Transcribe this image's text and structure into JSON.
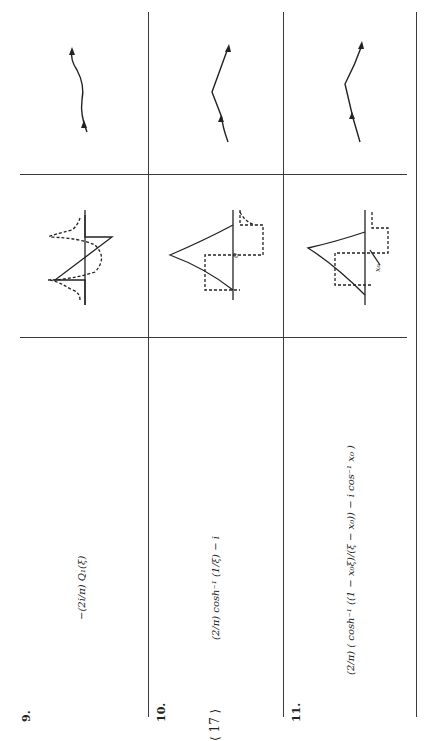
{
  "page_number": "⟨ 17 ⟩",
  "rows": [
    {
      "number": "9.",
      "formula": "−(2i/π) Q₁(ξ)",
      "diagram": "sawtooth-with-dashed-singular-curve",
      "contour": "wavy-path-with-arrows"
    },
    {
      "number": "10.",
      "formula": "(2/π) cosh⁻¹ (1/ξ) − i",
      "diagram": "cusp-peak-with-dashed-step",
      "diagram_label": "0",
      "contour": "v-shaped-path-with-arrows"
    },
    {
      "number": "11.",
      "formula": "(2/π) ( cosh⁻¹ ((1 − x₀ξ)/(ξ − x₀)) − i cos⁻¹ x₀ )",
      "diagram": "cusp-peak-with-dashed-step-offset",
      "diagram_label": "x₀",
      "contour": "v-shaped-path-with-arrows"
    }
  ]
}
